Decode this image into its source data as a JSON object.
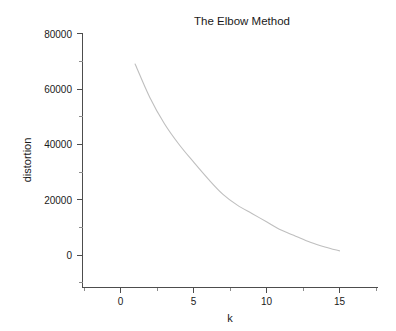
{
  "chart_data": {
    "type": "line",
    "title": "The Elbow Method",
    "xlabel": "k",
    "ylabel": "distortion",
    "x": [
      1,
      2,
      3,
      4,
      5,
      6,
      7,
      8,
      9,
      10,
      11,
      12,
      13,
      14,
      15
    ],
    "values": [
      69000,
      57000,
      47500,
      40000,
      33600,
      27500,
      22000,
      18000,
      15000,
      12000,
      9000,
      6800,
      4600,
      2900,
      1500
    ],
    "series": [
      {
        "name": "distortion",
        "values": [
          69000,
          57000,
          47500,
          40000,
          33600,
          27500,
          22000,
          18000,
          15000,
          12000,
          9000,
          6800,
          4600,
          2900,
          1500
        ]
      }
    ],
    "xlim": [
      -2.6,
      17.6
    ],
    "ylim": [
      -10500,
      80000
    ],
    "x_ticks": [
      0,
      5,
      10,
      15
    ],
    "x_tick_labels": [
      "0",
      "5",
      "10",
      "15"
    ],
    "y_ticks": [
      0,
      20000,
      40000,
      60000,
      80000
    ],
    "y_tick_labels": [
      "0",
      "20000",
      "40000",
      "60000",
      "80000"
    ],
    "x_minor_ticks": [
      -2.5,
      2.5,
      7.5,
      12.5,
      17.5
    ],
    "y_minor_ticks": [
      -10000,
      10000,
      30000,
      50000,
      70000
    ],
    "grid": false,
    "legend": "none",
    "line_color": "#bfbfbf",
    "axis_color": "#4d4d4d",
    "text_color": "#1a1a1a",
    "background_color": "#ffffff",
    "annotations": []
  },
  "figure": {
    "title": "The Elbow Method",
    "x_axis_title": "k",
    "y_axis_title": "distortion"
  }
}
